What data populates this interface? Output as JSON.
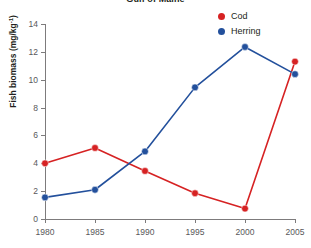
{
  "chart_data": {
    "type": "line",
    "title": "Gulf of Maine",
    "xlabel": "",
    "ylabel": "Fish biomass (mg/kg",
    "ylabel_sup": "-1",
    "ylabel_tail": ")",
    "x": [
      1980,
      1985,
      1990,
      1995,
      2000,
      2005
    ],
    "xticklabels": [
      "1980",
      "1985",
      "1990",
      "1995",
      "2000",
      "2005"
    ],
    "yticks": [
      0,
      2,
      4,
      6,
      8,
      10,
      12,
      14
    ],
    "yticklabels": [
      "0",
      "2",
      "4",
      "6",
      "8",
      "10",
      "12",
      "14"
    ],
    "xlim": [
      1980,
      2005
    ],
    "ylim": [
      0,
      14
    ],
    "grid": false,
    "legend_position": "top-right",
    "series": [
      {
        "name": "Cod",
        "color": "#d62223",
        "values": [
          4.0,
          5.1,
          3.45,
          1.85,
          0.75,
          11.3
        ]
      },
      {
        "name": "Herring",
        "color": "#23509c",
        "values": [
          1.55,
          2.1,
          4.85,
          9.45,
          12.35,
          10.4
        ]
      }
    ]
  },
  "legend": {
    "items": [
      {
        "label": "Cod",
        "color": "#d62223"
      },
      {
        "label": "Herring",
        "color": "#23509c"
      }
    ]
  },
  "colors": {
    "cod": "#d62223",
    "herring": "#23509c",
    "axis": "#7d7b7c",
    "tick_text": "#58585a",
    "title_text": "#231f20",
    "background": "#ffffff"
  }
}
